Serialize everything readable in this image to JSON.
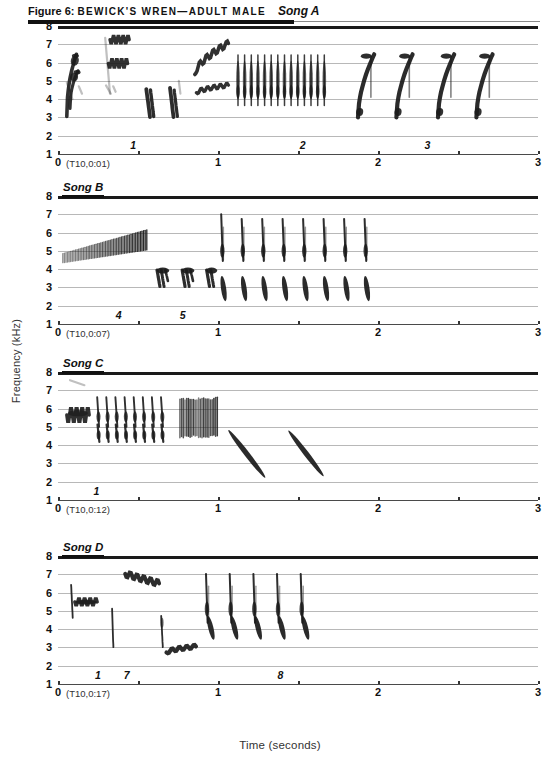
{
  "caption": {
    "figure_number": "Figure 6:",
    "species": "BEWICK'S WREN—ADULT MALE",
    "song_tag": "Song A"
  },
  "axes": {
    "ylabel": "Frequency (kHz)",
    "xlabel": "Time (seconds)",
    "yticks": [
      "8",
      "7",
      "6",
      "5",
      "4",
      "3",
      "2",
      "1"
    ],
    "ylim": [
      1,
      8
    ],
    "xticks": [
      "0",
      "1",
      "2",
      "3"
    ],
    "xtick_values": [
      0,
      0.5,
      1,
      1.5,
      2,
      2.5,
      3
    ],
    "xlim": [
      0,
      3
    ],
    "grid": true
  },
  "panels": [
    {
      "label": "Song A",
      "timecode": "(T10,0:01)",
      "phrase_marks": [
        {
          "text": "1",
          "t": 0.47
        },
        {
          "text": "2",
          "t": 1.53
        },
        {
          "text": "3",
          "t": 2.31
        }
      ]
    },
    {
      "label": "Song B",
      "timecode": "(T10,0:07)",
      "phrase_marks": [
        {
          "text": "4",
          "t": 0.38
        },
        {
          "text": "5",
          "t": 0.78
        }
      ]
    },
    {
      "label": "Song C",
      "timecode": "(T10,0:12)",
      "phrase_marks": [
        {
          "text": "1",
          "t": 0.24
        }
      ]
    },
    {
      "label": "Song D",
      "timecode": "(T10,0:17)",
      "phrase_marks": [
        {
          "text": "1",
          "t": 0.25
        },
        {
          "text": "7",
          "t": 0.43
        },
        {
          "text": "8",
          "t": 1.39
        }
      ]
    }
  ],
  "chart_data": {
    "type": "spectrogram",
    "title": "Figure 6: BEWICK'S WREN—ADULT MALE Song A",
    "xlabel": "Time (seconds)",
    "ylabel": "Frequency (kHz)",
    "xlim": [
      0,
      3
    ],
    "ylim": [
      1,
      8
    ],
    "panels": [
      {
        "name": "Song A",
        "timecode": "(T10,0:01)",
        "elements": [
          {
            "kind": "upsweep-pair",
            "t0": 0.06,
            "t1": 0.17,
            "f_low": 3.0,
            "f_high": 6.4,
            "note": "introductory complex note"
          },
          {
            "kind": "faint-upsweep",
            "t0": 0.3,
            "t1": 0.36,
            "f_low": 4.3,
            "f_high": 7.3,
            "note": "faint high note"
          },
          {
            "kind": "warble",
            "t0": 0.33,
            "t1": 0.45,
            "f_low": 6.9,
            "f_high": 7.4,
            "note": "high warble"
          },
          {
            "kind": "warble",
            "t0": 0.32,
            "t1": 0.44,
            "f_low": 5.7,
            "f_high": 6.2,
            "note": "mid warble"
          },
          {
            "kind": "downstroke",
            "t0": 0.55,
            "t1": 0.6,
            "f_low": 3.0,
            "f_high": 4.5
          },
          {
            "kind": "downstroke",
            "t0": 0.7,
            "t1": 0.75,
            "f_low": 3.0,
            "f_high": 4.6
          },
          {
            "kind": "warble-rise",
            "t0": 0.86,
            "t1": 1.06,
            "f_low": 5.4,
            "f_high": 7.1,
            "note": "upslurred warble"
          },
          {
            "kind": "warble-rise",
            "t0": 0.86,
            "t1": 1.06,
            "f_low": 4.3,
            "f_high": 4.8,
            "note": "lower warble"
          },
          {
            "kind": "trill",
            "t0": 1.12,
            "t1": 1.7,
            "f_low": 3.6,
            "f_high": 6.4,
            "count": 14,
            "note": "rapid trill"
          },
          {
            "kind": "upslur",
            "t0": 1.87,
            "t1": 2.0,
            "f_low": 3.0,
            "f_high": 6.4,
            "count": 4,
            "note": "terminal upslurs"
          },
          {
            "kind": "upslur",
            "t0": 2.12,
            "t1": 2.25,
            "f_low": 3.0,
            "f_high": 6.4
          },
          {
            "kind": "upslur",
            "t0": 2.38,
            "t1": 2.51,
            "f_low": 3.0,
            "f_high": 6.4
          },
          {
            "kind": "upslur",
            "t0": 2.62,
            "t1": 2.75,
            "f_low": 3.0,
            "f_high": 6.5
          }
        ]
      },
      {
        "name": "Song B",
        "timecode": "(T10,0:07)",
        "elements": [
          {
            "kind": "dense-trill",
            "t0": 0.03,
            "t1": 0.56,
            "f_low": 4.3,
            "f_high": 6.1,
            "note": "long rising buzzy trill"
          },
          {
            "kind": "buzz-note",
            "t0": 0.62,
            "t1": 0.7,
            "f_low": 3.1,
            "f_high": 4.1
          },
          {
            "kind": "buzz-note",
            "t0": 0.77,
            "t1": 0.85,
            "f_low": 3.1,
            "f_high": 4.1
          },
          {
            "kind": "buzz-note",
            "t0": 0.92,
            "t1": 1.0,
            "f_low": 3.5,
            "f_high": 4.1
          },
          {
            "kind": "paired-notes",
            "t0": 1.02,
            "t1": 1.95,
            "count": 8,
            "high_f_low": 4.4,
            "high_f_high": 7.0,
            "low_f_low": 2.2,
            "low_f_high": 3.6,
            "note": "8 repeated high-spike + low-dagger pairs"
          }
        ]
      },
      {
        "name": "Song C",
        "timecode": "(T10,0:12)",
        "elements": [
          {
            "kind": "faint-note",
            "t0": 0.08,
            "t1": 0.16,
            "f_low": 7.3,
            "f_high": 7.6
          },
          {
            "kind": "warble",
            "t0": 0.06,
            "t1": 0.19,
            "f_low": 5.2,
            "f_high": 6.1
          },
          {
            "kind": "paired-trill",
            "t0": 0.24,
            "t1": 0.7,
            "count": 8,
            "high_f_low": 5.0,
            "high_f_high": 6.6,
            "low_f_low": 4.2,
            "low_f_high": 5.1,
            "note": "8 paired trill notes"
          },
          {
            "kind": "buzz-block",
            "t0": 0.76,
            "t1": 1.0,
            "f_low": 4.4,
            "f_high": 6.6,
            "note": "dense buzz"
          },
          {
            "kind": "downslur",
            "t0": 1.06,
            "t1": 1.3,
            "f_low": 2.2,
            "f_high": 4.8
          },
          {
            "kind": "downslur",
            "t0": 1.44,
            "t1": 1.66,
            "f_low": 2.3,
            "f_high": 4.8
          }
        ]
      },
      {
        "name": "Song D",
        "timecode": "(T10,0:17)",
        "elements": [
          {
            "kind": "upstroke",
            "t0": 0.08,
            "t1": 0.11,
            "f_low": 4.6,
            "f_high": 6.4
          },
          {
            "kind": "warble",
            "t0": 0.11,
            "t1": 0.24,
            "f_low": 5.3,
            "f_high": 5.7
          },
          {
            "kind": "downstroke",
            "t0": 0.34,
            "t1": 0.37,
            "f_low": 3.0,
            "f_high": 5.1
          },
          {
            "kind": "warble-descend",
            "t0": 0.42,
            "t1": 0.63,
            "f_low": 6.5,
            "f_high": 7.0,
            "note": "descending high warble"
          },
          {
            "kind": "downstroke",
            "t0": 0.64,
            "t1": 0.68,
            "f_low": 3.0,
            "f_high": 4.7
          },
          {
            "kind": "low-warble",
            "t0": 0.68,
            "t1": 0.86,
            "f_low": 2.7,
            "f_high": 3.1
          },
          {
            "kind": "paired-notes",
            "t0": 0.92,
            "t1": 1.52,
            "count": 5,
            "high_f_low": 4.3,
            "high_f_high": 7.0,
            "low_f_low": 3.4,
            "low_f_high": 4.7,
            "note": "5 spike + downslur dagger pairs"
          }
        ]
      }
    ]
  }
}
